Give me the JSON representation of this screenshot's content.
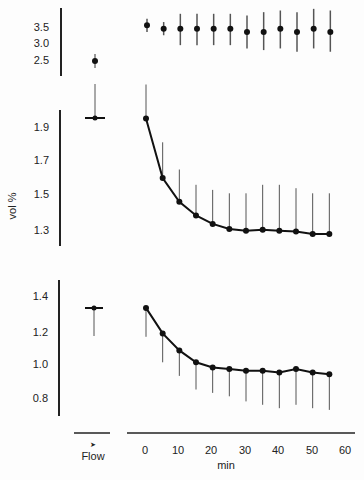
{
  "chart_data": [
    {
      "type": "line",
      "panel": "top",
      "title": "",
      "xlabel": "min",
      "ylabel": "",
      "y_ticks": [
        "3.5",
        "3.0",
        "2.5"
      ],
      "ylim": [
        2.3,
        3.9
      ],
      "flow": {
        "label": "Flow",
        "value": 2.5,
        "err_low": 2.4,
        "err_high": 2.6
      },
      "x": [
        0,
        5,
        10,
        15,
        20,
        25,
        30,
        35,
        40,
        45,
        50,
        55
      ],
      "values": [
        3.55,
        3.45,
        3.45,
        3.45,
        3.45,
        3.45,
        3.35,
        3.35,
        3.45,
        3.35,
        3.45,
        3.35
      ],
      "err_low": [
        3.35,
        3.25,
        2.95,
        2.95,
        2.95,
        2.95,
        2.85,
        2.8,
        2.85,
        2.75,
        2.85,
        2.75
      ],
      "err_high": [
        3.75,
        3.65,
        3.9,
        3.9,
        3.9,
        3.9,
        3.85,
        3.95,
        4.0,
        3.95,
        4.05,
        4.0
      ],
      "connected": false
    },
    {
      "type": "line",
      "panel": "middle",
      "xlabel": "min",
      "ylabel": "vol %",
      "y_ticks": [
        "1.9",
        "1.7",
        "1.5",
        "1.3"
      ],
      "ylim": [
        1.2,
        2.0
      ],
      "flow": {
        "label": "Flow",
        "value": 1.95,
        "err_high": 2.15
      },
      "x": [
        0,
        5,
        10,
        15,
        20,
        25,
        30,
        35,
        40,
        45,
        50,
        55
      ],
      "values": [
        1.95,
        1.6,
        1.46,
        1.38,
        1.33,
        1.3,
        1.29,
        1.295,
        1.29,
        1.285,
        1.27,
        1.27
      ],
      "err_high": [
        2.15,
        1.81,
        1.65,
        1.56,
        1.53,
        1.51,
        1.51,
        1.56,
        1.56,
        1.54,
        1.51,
        1.51
      ],
      "connected": true
    },
    {
      "type": "line",
      "panel": "bottom",
      "xlabel": "min",
      "ylabel": "",
      "y_ticks": [
        "1.4",
        "1.2",
        "1.0",
        "0.8"
      ],
      "ylim": [
        0.7,
        1.5
      ],
      "flow": {
        "label": "Flow",
        "value": 1.33,
        "err_low": 1.17
      },
      "x": [
        0,
        5,
        10,
        15,
        20,
        25,
        30,
        35,
        40,
        45,
        50,
        55
      ],
      "values": [
        1.33,
        1.18,
        1.08,
        1.01,
        0.98,
        0.97,
        0.96,
        0.96,
        0.95,
        0.97,
        0.95,
        0.94
      ],
      "err_low": [
        1.16,
        1.01,
        0.93,
        0.85,
        0.83,
        0.81,
        0.78,
        0.76,
        0.74,
        0.76,
        0.74,
        0.73
      ],
      "connected": true
    }
  ],
  "axis": {
    "x_ticks": [
      "0",
      "10",
      "20",
      "30",
      "40",
      "50",
      "60"
    ],
    "xlabel": "min",
    "flow_label": "Flow",
    "flow_arrow": "➤",
    "ylabel_middle": "vol %"
  },
  "top_ticks": [
    "3.5",
    "3.0",
    "2.5"
  ],
  "mid_ticks": [
    "1.9",
    "1.7",
    "1.5",
    "1.3"
  ],
  "bot_ticks": [
    "1.4",
    "1.2",
    "1.0",
    "0.8"
  ]
}
